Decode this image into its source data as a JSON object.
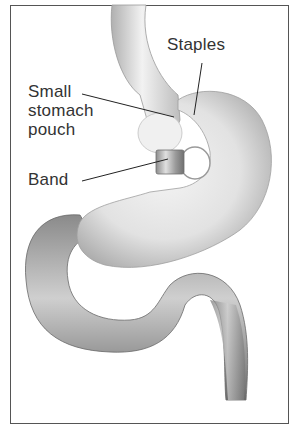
{
  "figure": {
    "title": "",
    "labels": {
      "staples": "Staples",
      "pouch_line1": "Small",
      "pouch_line2": "stomach",
      "pouch_line3": "pouch",
      "band": "Band"
    },
    "colors": {
      "border": "#555555",
      "organ_fill": "#e6e6e6",
      "organ_shadow": "#9a9a9a",
      "intestine_fill": "#b5b5b5",
      "intestine_dark": "#6e6e6e",
      "leader_line": "#222222",
      "text": "#333333"
    }
  }
}
